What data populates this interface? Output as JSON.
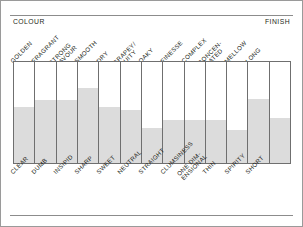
{
  "header": {
    "left_axis_label": "COLOUR",
    "right_axis_label": "FINISH"
  },
  "chart_data": {
    "type": "bar",
    "title": "",
    "subtitle": "",
    "xlabel": "",
    "ylabel": "",
    "ylim": [
      0,
      100
    ],
    "grid": false,
    "legend": "none",
    "orientation": "vertical",
    "axis_headers": {
      "left": "COLOUR",
      "right": "FINISH"
    },
    "note": "Bipolar tasting-profile chart: each column is an attribute with a positive descriptor above and a negative descriptor below. Fill height = score percent of column.",
    "categories": [
      "GOLDEN",
      "FRAGRANT",
      "STRONG FLAVOUR",
      "SMOOTH",
      "DRY",
      "GRAPEY/ FRUITY",
      "OAKY",
      "FINESSE",
      "COMPLEX",
      "CONCEN- TRATED",
      "MELLOW",
      "LONG",
      ""
    ],
    "top_labels": [
      "GOLDEN",
      "FRAGRANT",
      "STRONG\nFLAVOUR",
      "SMOOTH",
      "DRY",
      "GRAPEY/\nFRUITY",
      "OAKY",
      "FINESSE",
      "COMPLEX",
      "CONCEN-\nTRATED",
      "MELLOW",
      "LONG"
    ],
    "bottom_labels": [
      "CLEAR",
      "DUMB",
      "INSIPID",
      "SHARP",
      "SWEET",
      "NEUTRAL",
      "STRAIGHT",
      "CLUMSINESS",
      "ONE DIM-\nENSIONAL",
      "THIN",
      "SPIRITY",
      "SHORT"
    ],
    "values": [
      55,
      62,
      62,
      74,
      55,
      52,
      34,
      42,
      42,
      42,
      32,
      63,
      44
    ],
    "colors": {
      "fill": "#dcdcdc",
      "grid_line": "#6f6f6f",
      "frame": "#9a9a9a",
      "text": "#231f20",
      "background": "#ffffff"
    }
  }
}
